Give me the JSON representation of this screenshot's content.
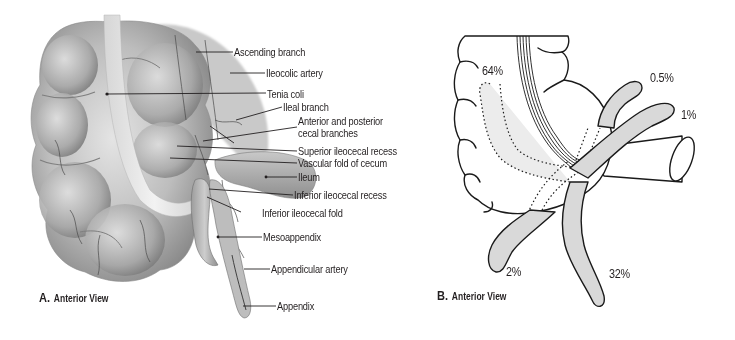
{
  "panel_a": {
    "caption": {
      "letter": "A.",
      "text": "Anterior View"
    },
    "labels": [
      "Ascending branch",
      "Ileocolic artery",
      "Tenia coli",
      "Ileal branch",
      "Anterior and posterior",
      "cecal branches",
      "Superior ileocecal recess",
      "Vascular fold of cecum",
      "Ileum",
      "Inferior ileocecal recess",
      "Inferior ileocecal fold",
      "Mesoappendix",
      "Appendicular artery",
      "Appendix"
    ]
  },
  "panel_b": {
    "caption": {
      "letter": "B.",
      "text": "Anterior View"
    },
    "percentages": {
      "retrocecal": "64%",
      "preileal": "0.5%",
      "postileal": "1%",
      "subcecal": "2%",
      "pelvic": "32%"
    }
  },
  "colors": {
    "text": "#231f20",
    "leader_line": "#231f20",
    "tissue_light": "#d8d8d8",
    "tissue_mid": "#a9a9a9",
    "tissue_dark": "#6e6e6e",
    "appendix_fill": "#d9d9d9",
    "outline": "#1a1a1a"
  }
}
